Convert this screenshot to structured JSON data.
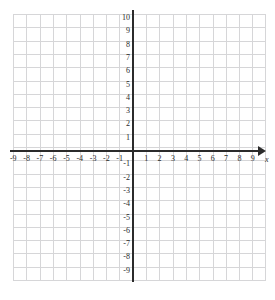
{
  "chart_data": {
    "type": "scatter",
    "title": "",
    "subtitle": "",
    "xlabel": "x",
    "ylabel": "",
    "xlim": [
      -9,
      9
    ],
    "ylim": [
      -9,
      10
    ],
    "grid": true,
    "legend": null,
    "series": [],
    "x_tick_labels": [
      "-9",
      "-8",
      "-7",
      "-6",
      "-5",
      "-4",
      "-3",
      "-2",
      "-1",
      "1",
      "2",
      "3",
      "4",
      "5",
      "6",
      "7",
      "8",
      "9"
    ],
    "y_tick_labels": [
      "10",
      "9",
      "8",
      "7",
      "6",
      "5",
      "4",
      "3",
      "2",
      "1",
      "-1",
      "-2",
      "-3",
      "-4",
      "-5",
      "-6",
      "-7",
      "-8",
      "-9"
    ],
    "annotations": []
  },
  "graph": {
    "x_axis": {
      "name": "x",
      "arrow": "right-arrow-icon",
      "negative_ticks": [
        {
          "label": "-9",
          "value": -9
        },
        {
          "label": "-8",
          "value": -8
        },
        {
          "label": "-7",
          "value": -7
        },
        {
          "label": "-6",
          "value": -6
        },
        {
          "label": "-5",
          "value": -5
        },
        {
          "label": "-4",
          "value": -4
        },
        {
          "label": "-3",
          "value": -3
        },
        {
          "label": "-2",
          "value": -2
        },
        {
          "label": "-1",
          "value": -1
        }
      ],
      "positive_ticks": [
        {
          "label": "1",
          "value": 1
        },
        {
          "label": "2",
          "value": 2
        },
        {
          "label": "3",
          "value": 3
        },
        {
          "label": "4",
          "value": 4
        },
        {
          "label": "5",
          "value": 5
        },
        {
          "label": "6",
          "value": 6
        },
        {
          "label": "7",
          "value": 7
        },
        {
          "label": "8",
          "value": 8
        },
        {
          "label": "9",
          "value": 9
        }
      ]
    },
    "y_axis": {
      "name": "",
      "positive_ticks": [
        {
          "label": "10",
          "value": 10
        },
        {
          "label": "9",
          "value": 9
        },
        {
          "label": "8",
          "value": 8
        },
        {
          "label": "7",
          "value": 7
        },
        {
          "label": "6",
          "value": 6
        },
        {
          "label": "5",
          "value": 5
        },
        {
          "label": "4",
          "value": 4
        },
        {
          "label": "3",
          "value": 3
        },
        {
          "label": "2",
          "value": 2
        },
        {
          "label": "1",
          "value": 1
        }
      ],
      "negative_ticks": [
        {
          "label": "-1",
          "value": -1
        },
        {
          "label": "-2",
          "value": -2
        },
        {
          "label": "-3",
          "value": -3
        },
        {
          "label": "-4",
          "value": -4
        },
        {
          "label": "-5",
          "value": -5
        },
        {
          "label": "-6",
          "value": -6
        },
        {
          "label": "-7",
          "value": -7
        },
        {
          "label": "-8",
          "value": -8
        },
        {
          "label": "-9",
          "value": -9
        }
      ]
    },
    "colors": {
      "grid_line": "#d6d6d8",
      "axis_line": "#2b2b2b",
      "label_text": "#2a2a2a",
      "background": "#ffffff"
    }
  }
}
